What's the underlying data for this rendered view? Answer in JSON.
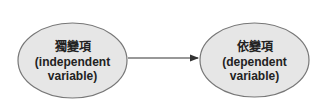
{
  "diagram": {
    "nodes": [
      {
        "id": "independent",
        "title": "獨變項",
        "line1": "(independent",
        "line2": "variable)",
        "fill": "#e6e6e6",
        "stroke": "#777777"
      },
      {
        "id": "dependent",
        "title": "依變項",
        "line1": "(dependent",
        "line2": "variable)",
        "fill": "#e6e6e6",
        "stroke": "#777777"
      }
    ],
    "edges": [
      {
        "from": "independent",
        "to": "dependent",
        "color": "#333333"
      }
    ]
  }
}
